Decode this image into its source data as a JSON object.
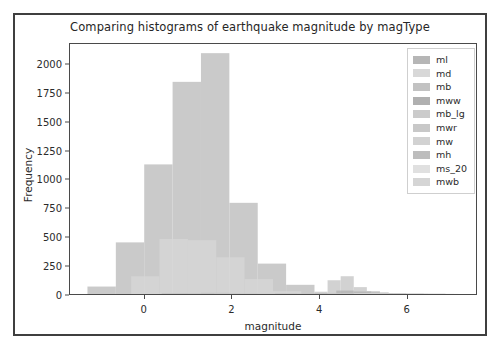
{
  "figure": {
    "title": "Comparing histograms of earthquake magnitude by magType"
  },
  "axes": {
    "xlabel": "magnitude",
    "ylabel": "Frequency",
    "xticks": [
      "0",
      "2",
      "4",
      "6"
    ],
    "yticks": [
      "0",
      "250",
      "500",
      "750",
      "1000",
      "1250",
      "1500",
      "1750",
      "2000"
    ]
  },
  "legend": {
    "entries": [
      {
        "label": "ml",
        "color": "#b6b6b6"
      },
      {
        "label": "md",
        "color": "#d8d8d8"
      },
      {
        "label": "mb",
        "color": "#c2c2c2"
      },
      {
        "label": "mww",
        "color": "#b0b0b0"
      },
      {
        "label": "mb_lg",
        "color": "#cbcbcb"
      },
      {
        "label": "mwr",
        "color": "#c8c8c8"
      },
      {
        "label": "mw",
        "color": "#d2d2d2"
      },
      {
        "label": "mh",
        "color": "#bdbdbd"
      },
      {
        "label": "ms_20",
        "color": "#e0e0e0"
      },
      {
        "label": "mwb",
        "color": "#d5d5d5"
      }
    ]
  },
  "chart_data": {
    "type": "bar",
    "title": "Comparing histograms of earthquake magnitude by magType",
    "xlabel": "magnitude",
    "ylabel": "Frequency",
    "xlim": [
      -1.7,
      7.6
    ],
    "ylim": [
      0,
      2180
    ],
    "grid": false,
    "legend_position": "upper right",
    "bin_width": 0.65,
    "series": [
      {
        "name": "ml",
        "color": "#b6b6b6",
        "bin_edges": [
          -1.3,
          -0.65,
          0.0,
          0.65,
          1.3,
          1.95,
          2.6,
          3.25,
          3.9,
          4.55,
          5.2,
          5.85,
          6.5
        ],
        "values": [
          65,
          450,
          1130,
          1850,
          2100,
          795,
          265,
          80,
          10,
          3,
          2,
          1
        ]
      },
      {
        "name": "md",
        "color": "#d8d8d8",
        "bin_edges": [
          -0.3,
          0.35,
          1.0,
          1.65,
          2.3,
          2.95,
          3.6
        ],
        "values": [
          155,
          480,
          470,
          320,
          130,
          25
        ]
      },
      {
        "name": "mb",
        "color": "#c2c2c2",
        "bin_edges": [
          3.9,
          4.2,
          4.5,
          4.8,
          5.1,
          5.4,
          5.7,
          6.0
        ],
        "values": [
          20,
          120,
          155,
          60,
          25,
          8,
          3
        ]
      },
      {
        "name": "mww",
        "color": "#b0b0b0",
        "bin_edges": [
          4.4,
          4.8,
          5.2,
          5.6,
          6.0,
          6.4,
          6.9
        ],
        "values": [
          30,
          22,
          14,
          7,
          4,
          2
        ]
      },
      {
        "name": "mb_lg",
        "color": "#cbcbcb",
        "bin_edges": [
          1.3,
          1.95,
          2.6,
          3.25
        ],
        "values": [
          12,
          8,
          3
        ]
      },
      {
        "name": "mwr",
        "color": "#c8c8c8",
        "bin_edges": [
          3.0,
          3.5,
          4.0,
          4.5
        ],
        "values": [
          9,
          6,
          3
        ]
      },
      {
        "name": "mw",
        "color": "#d2d2d2",
        "bin_edges": [
          4.2,
          4.8,
          5.4,
          6.0
        ],
        "values": [
          7,
          5,
          2
        ]
      },
      {
        "name": "mh",
        "color": "#bdbdbd",
        "bin_edges": [
          0.4,
          1.0,
          1.6,
          2.2
        ],
        "values": [
          6,
          5,
          2
        ]
      },
      {
        "name": "ms_20",
        "color": "#e0e0e0",
        "bin_edges": [
          4.8,
          5.4,
          6.0,
          6.6,
          7.2
        ],
        "values": [
          6,
          5,
          3,
          1
        ]
      },
      {
        "name": "mwb",
        "color": "#d5d5d5",
        "bin_edges": [
          5.0,
          5.7,
          6.4,
          7.1
        ],
        "values": [
          4,
          3,
          1
        ]
      }
    ]
  }
}
